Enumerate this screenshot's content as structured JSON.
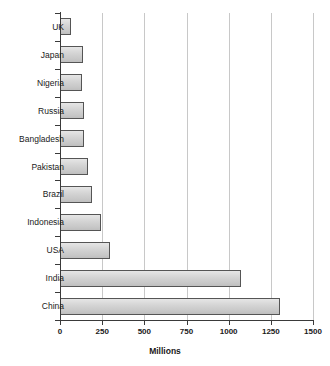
{
  "chart_data": {
    "type": "bar",
    "orientation": "horizontal",
    "title": "",
    "xlabel": "Millions",
    "ylabel": "",
    "categories": [
      "UK",
      "Japan",
      "Nigeria",
      "Russia",
      "Bangladesh",
      "Pakistan",
      "Brazil",
      "Indonesia",
      "USA",
      "India",
      "China"
    ],
    "values": [
      65,
      136,
      130,
      143,
      144,
      166,
      190,
      243,
      296,
      1073,
      1304
    ],
    "xlim": [
      0,
      1500
    ],
    "xticks": [
      0,
      250,
      500,
      750,
      1000,
      1250,
      1500
    ],
    "xtick_labels": [
      "0",
      "250",
      "500",
      "750",
      "1000",
      "1250",
      "1500"
    ],
    "grid": "vertical",
    "legend": null,
    "bar_fill_color": "#d2d2d2",
    "bar_edge_color": "#555555",
    "grid_color": "#c8c8c8",
    "axis_color": "#3a3a3a",
    "background_color": "#ffffff"
  },
  "axis": {
    "x_title": "Millions"
  }
}
